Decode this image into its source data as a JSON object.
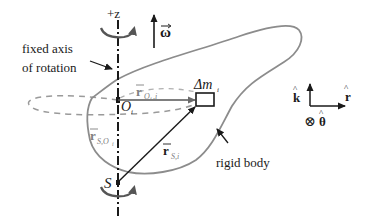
{
  "diagram": {
    "labels": {
      "axis_direction": "+z",
      "omega": "ω",
      "fixed_axis_line1": "fixed axis",
      "fixed_axis_line2": "of rotation",
      "r_Oi_i_main": "r",
      "r_Oi_i_sub": "O",
      "r_Oi_i_subsub": "i",
      "r_Oi_i_sub2": ",i",
      "mass_element_main": "Δm",
      "mass_element_sub": "i",
      "point_Oi_main": "O",
      "point_Oi_sub": "i",
      "r_S_Oi_main": "r",
      "r_S_Oi_sub": "S,O",
      "r_S_Oi_subsub": "i",
      "r_S_i_main": "r",
      "r_S_i_sub": "S,i",
      "point_S": "S",
      "rigid_body": "rigid body",
      "unit_k": "k",
      "unit_r": "r",
      "unit_theta_symbol": "⊗",
      "unit_theta": "θ"
    },
    "unit_vectors": [
      "k̂",
      "r̂",
      "θ̂ (into page)"
    ],
    "colors": {
      "ink": "#1a1a1a",
      "body_outline": "#8c8c8c",
      "dashed_orbit": "#9a9a9a",
      "subscript_gray": "#808080"
    }
  }
}
